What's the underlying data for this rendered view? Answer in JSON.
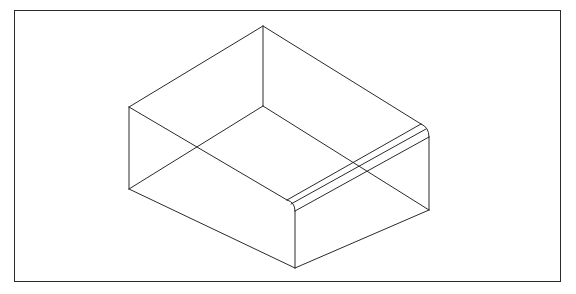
{
  "figure": {
    "line_color": "#2a2a2a",
    "background": "#ffffff"
  },
  "frame": {
    "x": 14,
    "y": 10,
    "width": 547,
    "height": 272
  },
  "vertices": {
    "top_back": [
      263,
      26
    ],
    "back_bottom": [
      263,
      106
    ],
    "left_top": [
      129,
      107
    ],
    "left_bottom": [
      129,
      189
    ],
    "front_bottom": [
      295,
      268
    ],
    "right_bottom": [
      429,
      210
    ],
    "front_round_start": [
      287,
      200
    ],
    "front_round_end": [
      295,
      211
    ],
    "right_round_start": [
      421,
      124
    ],
    "right_round_end": [
      429,
      137
    ]
  },
  "fillet_lines": [
    {
      "from": [
        287,
        200
      ],
      "to": [
        421,
        124
      ]
    },
    {
      "from": [
        291,
        204
      ],
      "to": [
        426,
        129
      ]
    },
    {
      "from": [
        295,
        211
      ],
      "to": [
        429,
        137
      ]
    }
  ]
}
